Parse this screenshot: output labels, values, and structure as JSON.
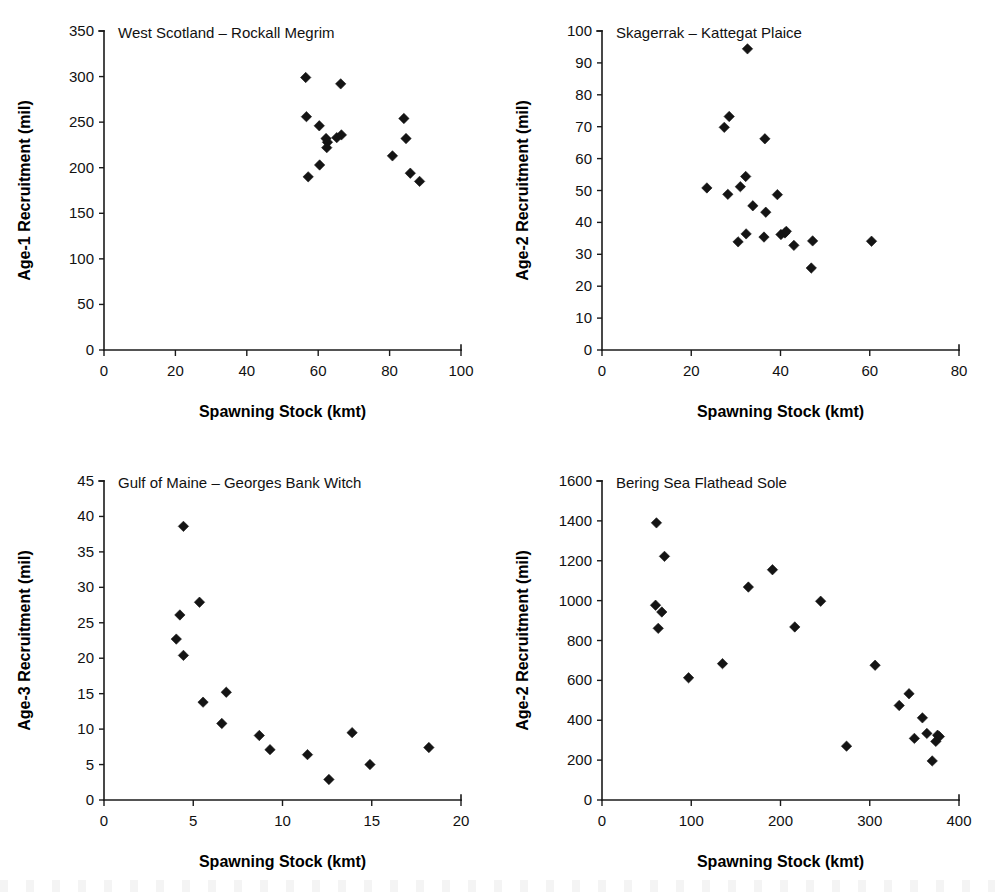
{
  "figure": {
    "background": "#ffffff",
    "marker_color": "#141414",
    "axis_color": "#1a1a1a",
    "shared_xlabel": "Spawning Stock (kmt)"
  },
  "chart_data": [
    {
      "id": "west-scotland-rockall-megrim",
      "type": "scatter",
      "title": "West Scotland – Rockall Megrim",
      "xlabel": "Spawning Stock (kmt)",
      "ylabel": "Age-1 Recruitment (mil)",
      "xlim": [
        0,
        100
      ],
      "ylim": [
        0,
        350
      ],
      "xticks": [
        0,
        20,
        40,
        60,
        80,
        100
      ],
      "yticks": [
        0,
        50,
        100,
        150,
        200,
        250,
        300,
        350
      ],
      "grid": false,
      "legend": null,
      "points": [
        {
          "x": 56.5,
          "y": 299
        },
        {
          "x": 66.3,
          "y": 292
        },
        {
          "x": 56.7,
          "y": 256
        },
        {
          "x": 60.3,
          "y": 246
        },
        {
          "x": 62.2,
          "y": 232
        },
        {
          "x": 62.6,
          "y": 228
        },
        {
          "x": 62.4,
          "y": 222
        },
        {
          "x": 65.2,
          "y": 233
        },
        {
          "x": 66.5,
          "y": 236
        },
        {
          "x": 60.4,
          "y": 203
        },
        {
          "x": 57.2,
          "y": 190
        },
        {
          "x": 84.0,
          "y": 254
        },
        {
          "x": 84.6,
          "y": 232
        },
        {
          "x": 80.8,
          "y": 213
        },
        {
          "x": 85.8,
          "y": 194
        },
        {
          "x": 88.4,
          "y": 185
        }
      ]
    },
    {
      "id": "skagerrak-kattegat-plaice",
      "type": "scatter",
      "title": "Skagerrak – Kattegat Plaice",
      "xlabel": "Spawning Stock (kmt)",
      "ylabel": "Age-2 Recruitment (mil)",
      "xlim": [
        0,
        80
      ],
      "ylim": [
        0,
        100
      ],
      "xticks": [
        0,
        20,
        40,
        60,
        80
      ],
      "yticks": [
        0,
        10,
        20,
        30,
        40,
        50,
        60,
        70,
        80,
        90,
        100
      ],
      "grid": false,
      "legend": null,
      "points": [
        {
          "x": 32.6,
          "y": 94.4
        },
        {
          "x": 28.5,
          "y": 73.2
        },
        {
          "x": 27.4,
          "y": 69.8
        },
        {
          "x": 36.5,
          "y": 66.2
        },
        {
          "x": 32.2,
          "y": 54.4
        },
        {
          "x": 23.5,
          "y": 50.8
        },
        {
          "x": 31.0,
          "y": 51.2
        },
        {
          "x": 28.2,
          "y": 48.8
        },
        {
          "x": 39.3,
          "y": 48.7
        },
        {
          "x": 33.8,
          "y": 45.2
        },
        {
          "x": 36.7,
          "y": 43.2
        },
        {
          "x": 32.3,
          "y": 36.4
        },
        {
          "x": 36.3,
          "y": 35.4
        },
        {
          "x": 40.1,
          "y": 36.2
        },
        {
          "x": 41.0,
          "y": 36.7
        },
        {
          "x": 41.3,
          "y": 37.2
        },
        {
          "x": 30.5,
          "y": 33.9
        },
        {
          "x": 43.0,
          "y": 32.8
        },
        {
          "x": 47.2,
          "y": 34.2
        },
        {
          "x": 60.4,
          "y": 34.1
        },
        {
          "x": 46.9,
          "y": 25.7
        }
      ]
    },
    {
      "id": "gulf-of-maine-georges-bank-witch",
      "type": "scatter",
      "title": "Gulf of Maine – Georges Bank Witch",
      "xlabel": "Spawning Stock (kmt)",
      "ylabel": "Age-3 Recruitment (mil)",
      "xlim": [
        0,
        20
      ],
      "ylim": [
        0,
        45
      ],
      "xticks": [
        0,
        5,
        10,
        15,
        20
      ],
      "yticks": [
        0,
        5,
        10,
        15,
        20,
        25,
        30,
        35,
        40,
        45
      ],
      "grid": false,
      "legend": null,
      "points": [
        {
          "x": 4.45,
          "y": 38.6
        },
        {
          "x": 5.35,
          "y": 27.9
        },
        {
          "x": 4.25,
          "y": 26.1
        },
        {
          "x": 4.05,
          "y": 22.7
        },
        {
          "x": 4.45,
          "y": 20.4
        },
        {
          "x": 6.85,
          "y": 15.2
        },
        {
          "x": 5.55,
          "y": 13.8
        },
        {
          "x": 6.6,
          "y": 10.8
        },
        {
          "x": 8.7,
          "y": 9.1
        },
        {
          "x": 13.9,
          "y": 9.5
        },
        {
          "x": 9.3,
          "y": 7.1
        },
        {
          "x": 18.2,
          "y": 7.4
        },
        {
          "x": 11.4,
          "y": 6.4
        },
        {
          "x": 14.9,
          "y": 5.0
        },
        {
          "x": 12.6,
          "y": 2.9
        }
      ]
    },
    {
      "id": "bering-sea-flathead-sole",
      "type": "scatter",
      "title": "Bering Sea Flathead Sole",
      "xlabel": "Spawning Stock (kmt)",
      "ylabel": "Age-2 Recruitment (mil)",
      "xlim": [
        0,
        400
      ],
      "ylim": [
        0,
        1600
      ],
      "xticks": [
        0,
        100,
        200,
        300,
        400
      ],
      "yticks": [
        0,
        200,
        400,
        600,
        800,
        1000,
        1200,
        1400,
        1600
      ],
      "grid": false,
      "legend": null,
      "points": [
        {
          "x": 61,
          "y": 1390
        },
        {
          "x": 70,
          "y": 1222
        },
        {
          "x": 191,
          "y": 1155
        },
        {
          "x": 164,
          "y": 1068
        },
        {
          "x": 245,
          "y": 997
        },
        {
          "x": 60,
          "y": 977
        },
        {
          "x": 67,
          "y": 943
        },
        {
          "x": 216,
          "y": 868
        },
        {
          "x": 63,
          "y": 861
        },
        {
          "x": 135,
          "y": 684
        },
        {
          "x": 306,
          "y": 676
        },
        {
          "x": 97,
          "y": 613
        },
        {
          "x": 344,
          "y": 533
        },
        {
          "x": 333,
          "y": 474
        },
        {
          "x": 359,
          "y": 412
        },
        {
          "x": 364,
          "y": 334
        },
        {
          "x": 376,
          "y": 325
        },
        {
          "x": 378,
          "y": 318
        },
        {
          "x": 350,
          "y": 309
        },
        {
          "x": 374,
          "y": 294
        },
        {
          "x": 274,
          "y": 270
        },
        {
          "x": 370,
          "y": 196
        }
      ]
    }
  ]
}
